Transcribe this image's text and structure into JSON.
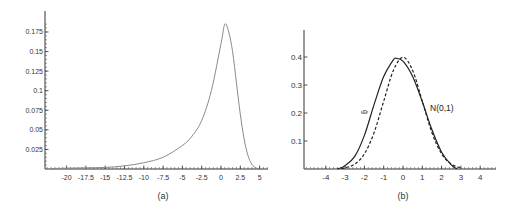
{
  "chart_data": [
    {
      "type": "line",
      "panel": "(a)",
      "caption": "(a)",
      "title": "",
      "xlabel": "",
      "ylabel": "",
      "xlim": [
        -23,
        6
      ],
      "ylim": [
        0,
        0.2
      ],
      "x_ticks": [
        -20,
        -17.5,
        -15,
        -12.5,
        -10,
        -7.5,
        -5,
        -2.5,
        0,
        2.5,
        5
      ],
      "x_tick_labels": [
        "-20",
        "-17.5",
        "-15",
        "-12.5",
        "-10",
        "-7.5",
        "-5",
        "-2.5",
        "0",
        "2.5",
        "5"
      ],
      "y_ticks": [
        0.025,
        0.05,
        0.075,
        0.1,
        0.125,
        0.15,
        0.175
      ],
      "y_tick_labels": [
        "0.025",
        "0.05",
        "0.075",
        "0.1",
        "0.125",
        "0.15",
        "0.175"
      ],
      "grid": false,
      "series": [
        {
          "name": "density",
          "style": "solid",
          "color": "#8a8a8a",
          "x": [
            -22,
            -20,
            -17.5,
            -15,
            -12.5,
            -10,
            -7.5,
            -5,
            -3.75,
            -2.5,
            -1.25,
            0,
            0.5,
            1,
            1.5,
            2,
            2.5,
            3,
            3.5,
            4,
            4.5,
            5
          ],
          "y": [
            0.0005,
            0.001,
            0.0015,
            0.002,
            0.004,
            0.008,
            0.015,
            0.03,
            0.042,
            0.062,
            0.1,
            0.16,
            0.185,
            0.175,
            0.15,
            0.11,
            0.07,
            0.038,
            0.017,
            0.006,
            0.0015,
            0.0
          ]
        }
      ]
    },
    {
      "type": "line",
      "panel": "(b)",
      "caption": "(b)",
      "title": "",
      "xlabel": "",
      "ylabel": "",
      "xlim": [
        -5,
        5
      ],
      "ylim": [
        0,
        0.5
      ],
      "x_ticks": [
        -4,
        -3,
        -2,
        -1,
        0,
        1,
        2,
        3,
        4
      ],
      "x_tick_labels": [
        "-4",
        "-3",
        "-2",
        "-1",
        "0",
        "1",
        "2",
        "3",
        "4"
      ],
      "y_ticks": [
        0.1,
        0.2,
        0.3,
        0.4
      ],
      "y_tick_labels": [
        "0.1",
        "0.2",
        "0.3",
        "0.4"
      ],
      "grid": false,
      "annotations": [
        {
          "text": "ĝ",
          "x": -2.0,
          "y": 0.2
        },
        {
          "text": "N(0,1)",
          "x": 1.75,
          "y": 0.21
        }
      ],
      "series": [
        {
          "name": "estimated density",
          "style": "solid",
          "color": "#222222",
          "x": [
            -3.4,
            -3.0,
            -2.5,
            -2.0,
            -1.5,
            -1.0,
            -0.5,
            -0.35,
            0,
            0.5,
            1.0,
            1.5,
            2.0,
            2.5,
            2.8
          ],
          "y": [
            0.0,
            0.012,
            0.045,
            0.12,
            0.23,
            0.33,
            0.39,
            0.395,
            0.385,
            0.33,
            0.24,
            0.14,
            0.06,
            0.015,
            0.0
          ]
        },
        {
          "name": "N(0,1)",
          "style": "dashed",
          "color": "#222222",
          "x": [
            -3.2,
            -3.0,
            -2.5,
            -2.0,
            -1.5,
            -1.0,
            -0.5,
            0,
            0.5,
            1.0,
            1.5,
            2.0,
            2.5,
            3.0
          ],
          "y": [
            0.002,
            0.0044,
            0.0175,
            0.054,
            0.1295,
            0.242,
            0.352,
            0.399,
            0.352,
            0.242,
            0.1295,
            0.054,
            0.0175,
            0.0044
          ]
        }
      ]
    }
  ],
  "captions": {
    "a": "(a)",
    "b": "(b)"
  },
  "labels": {
    "estimate_label": "ĝ",
    "normal_label": "N(0,1)"
  }
}
